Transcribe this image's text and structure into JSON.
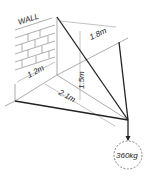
{
  "diagram": {
    "wall_label": "WALL",
    "dims": {
      "width_wall": "1.2m",
      "height": "1.5m",
      "top_right": "1.8m",
      "diagonal": "2.1m"
    },
    "load_label": "360kg",
    "colors": {
      "line": "#222222",
      "thin": "#888888",
      "background": "#ffffff"
    }
  }
}
